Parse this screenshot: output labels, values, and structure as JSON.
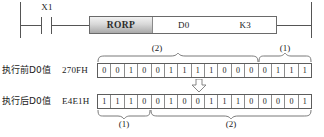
{
  "ladder": {
    "contact": {
      "label": "X1",
      "type": "normally-open-contact"
    },
    "instruction": {
      "opcode": "RORP",
      "operand1": "D0",
      "operand2": "K3"
    }
  },
  "rows": {
    "before": {
      "label": "执行前D0值",
      "hex": "270FH",
      "bits": [
        "0",
        "0",
        "1",
        "0",
        "0",
        "1",
        "1",
        "1",
        "1",
        "0",
        "0",
        "0",
        "0",
        "1",
        "1",
        "1"
      ]
    },
    "after": {
      "label": "执行后D0值",
      "hex": "E4E1H",
      "bits": [
        "1",
        "1",
        "1",
        "0",
        "0",
        "1",
        "0",
        "0",
        "1",
        "1",
        "1",
        "0",
        "0",
        "0",
        "0",
        "1"
      ]
    }
  },
  "annotations": {
    "top_left_group": "(2)",
    "top_right_group": "(1)",
    "bottom_left_group": "(1)",
    "bottom_right_group": "(2)",
    "arrow": "down-arrow"
  },
  "colors": {
    "line": "#5d5d5d",
    "text": "#1a1a1a",
    "opcode_fill": "#d8d8d8"
  }
}
